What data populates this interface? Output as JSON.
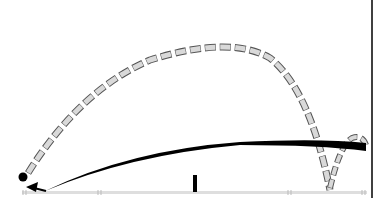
{
  "diagram": {
    "type": "projectile-trajectory",
    "colors": {
      "background": "#ffffff",
      "ground": "#dcdcdc",
      "solid_path": "#000000",
      "dashed_fill": "#d9d9d9",
      "dashed_stroke": "#555555",
      "wall": "#000000"
    },
    "elements": [
      "ball",
      "launch-arrow",
      "solid-low-trajectory",
      "dashed-high-trajectory",
      "dashed-bounce-arc",
      "ground-line",
      "short-post",
      "right-wall"
    ]
  }
}
